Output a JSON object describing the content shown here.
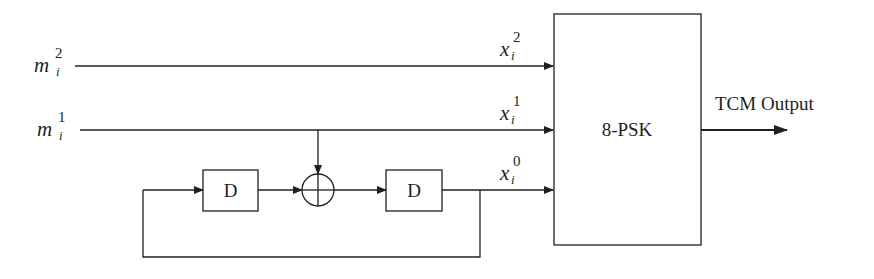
{
  "diagram": {
    "inputs": [
      {
        "var": "m",
        "sup": "2",
        "sub": "i"
      },
      {
        "var": "m",
        "sup": "1",
        "sub": "i"
      }
    ],
    "outputs_to_mapper": [
      {
        "var": "x",
        "sup": "2",
        "sub": "i"
      },
      {
        "var": "x",
        "sup": "1",
        "sub": "i"
      },
      {
        "var": "x",
        "sup": "0",
        "sub": "i"
      }
    ],
    "delay_blocks": [
      {
        "label": "D"
      },
      {
        "label": "D"
      }
    ],
    "adder": {
      "symbol": "xor"
    },
    "mapper": {
      "label": "8-PSK"
    },
    "output": {
      "label": "TCM Output"
    },
    "colors": {
      "stroke": "#231f20",
      "background": "#ffffff"
    }
  }
}
